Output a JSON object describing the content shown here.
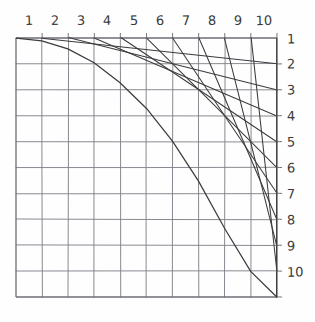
{
  "figure": {
    "style": "pencil sketch on white paper",
    "colors": {
      "background": "#fefefe",
      "grid_line": "#7a7d85",
      "grid_border": "#6b6e76",
      "envelope_line": "#3c3c3c",
      "label_text": "#3a3a3a"
    }
  },
  "axes": {
    "top_labels": [
      "1",
      "2",
      "3",
      "4",
      "5",
      "6",
      "7",
      "8",
      "9",
      "10"
    ],
    "right_labels": [
      "1",
      "2",
      "3",
      "4",
      "5",
      "6",
      "7",
      "8",
      "9",
      "10"
    ]
  },
  "chart_data": {
    "type": "line",
    "xlabel": "",
    "ylabel": "",
    "xlim": [
      0,
      10
    ],
    "ylim": [
      0,
      10
    ],
    "grid": true,
    "legend_position": "none",
    "categories": [
      "1",
      "2",
      "3",
      "4",
      "5",
      "6",
      "7",
      "8",
      "9",
      "10"
    ],
    "grid_divisions": 10,
    "series": [
      {
        "name": "chord-1",
        "x": [
          1,
          10
        ],
        "y": [
          0,
          1
        ]
      },
      {
        "name": "chord-2",
        "x": [
          2,
          10
        ],
        "y": [
          0,
          2
        ]
      },
      {
        "name": "chord-3",
        "x": [
          3,
          10
        ],
        "y": [
          0,
          3
        ]
      },
      {
        "name": "chord-4",
        "x": [
          4,
          10
        ],
        "y": [
          0,
          4
        ]
      },
      {
        "name": "chord-5",
        "x": [
          5,
          10
        ],
        "y": [
          0,
          5
        ]
      },
      {
        "name": "chord-6",
        "x": [
          6,
          10
        ],
        "y": [
          0,
          6
        ]
      },
      {
        "name": "chord-7",
        "x": [
          7,
          10
        ],
        "y": [
          0,
          7
        ]
      },
      {
        "name": "chord-8",
        "x": [
          8,
          10
        ],
        "y": [
          0,
          8
        ]
      },
      {
        "name": "chord-9",
        "x": [
          9,
          10
        ],
        "y": [
          0,
          9
        ]
      },
      {
        "name": "chord-10",
        "x": [
          10,
          10
        ],
        "y": [
          0,
          10
        ]
      }
    ],
    "envelope": {
      "name": "envelope-curve",
      "from": [
        0,
        0
      ],
      "to": [
        10,
        10
      ],
      "x": [
        0.0,
        1.0,
        2.0,
        3.0,
        4.0,
        5.0,
        6.0,
        7.0,
        8.0,
        9.0,
        10.0
      ],
      "y": [
        0.0,
        0.11,
        0.42,
        0.95,
        1.72,
        2.73,
        4.0,
        5.54,
        7.38,
        9.0,
        10.0
      ]
    }
  }
}
